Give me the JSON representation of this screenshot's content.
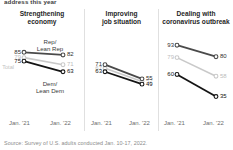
{
  "kicker": "address this year",
  "source": "Source: Survey of U.S. adults conducted Jan. 10-17, 2022.",
  "axis": {
    "left_tick": "Jan. '21",
    "right_tick": "Jan. '22"
  },
  "annotations": {
    "rep": "Rep/",
    "rep2": "Lean Rep",
    "dem": "Dem/",
    "dem2": "Lean Dem",
    "total": "Total"
  },
  "colors": {
    "rep": "#4a4a4a",
    "total": "#c9c9c9",
    "dem": "#141414",
    "axis": "#d8d8d8",
    "divider": "#e0e0e0"
  },
  "chart_data": {
    "type": "line",
    "title": "address this year",
    "xlabel": "",
    "ylabel": "",
    "x": [
      "Jan. '21",
      "Jan. '22"
    ],
    "ylim": [
      30,
      100
    ],
    "grid": false,
    "legend": "inline annotations",
    "panels": [
      {
        "title": "Strengthening",
        "title2": "economy",
        "series": [
          {
            "name": "Rep/Lean Rep",
            "values": [
              85,
              82
            ],
            "labels": [
              "85",
              "82"
            ],
            "color": "#4a4a4a"
          },
          {
            "name": "Total",
            "values": [
              79,
              71
            ],
            "labels": [
              "79",
              "71"
            ],
            "color": "#c9c9c9"
          },
          {
            "name": "Dem/Lean Dem",
            "values": [
              75,
              63
            ],
            "labels": [
              "75",
              "63"
            ],
            "color": "#141414"
          }
        ]
      },
      {
        "title": "Improving",
        "title2": "job situation",
        "series": [
          {
            "name": "Rep/Lean Rep",
            "values": [
              71,
              55
            ],
            "labels": [
              "71",
              "55"
            ],
            "color": "#4a4a4a"
          },
          {
            "name": "Total",
            "values": [
              67,
              52
            ],
            "labels": [
              "67",
              "52"
            ],
            "color": "#c9c9c9"
          },
          {
            "name": "Dem/Lean Dem",
            "values": [
              63,
              49
            ],
            "labels": [
              "63",
              "49"
            ],
            "color": "#141414"
          }
        ]
      },
      {
        "title": "Dealing with",
        "title2": "coronavirus outbreak",
        "series": [
          {
            "name": "Rep/Lean Rep",
            "values": [
              93,
              80
            ],
            "labels": [
              "93",
              "80"
            ],
            "color": "#4a4a4a"
          },
          {
            "name": "Total",
            "values": [
              79,
              58
            ],
            "labels": [
              "79",
              "58"
            ],
            "color": "#c9c9c9"
          },
          {
            "name": "Dem/Lean Dem",
            "values": [
              60,
              35
            ],
            "labels": [
              "60",
              "35"
            ],
            "color": "#141414"
          }
        ]
      }
    ]
  }
}
